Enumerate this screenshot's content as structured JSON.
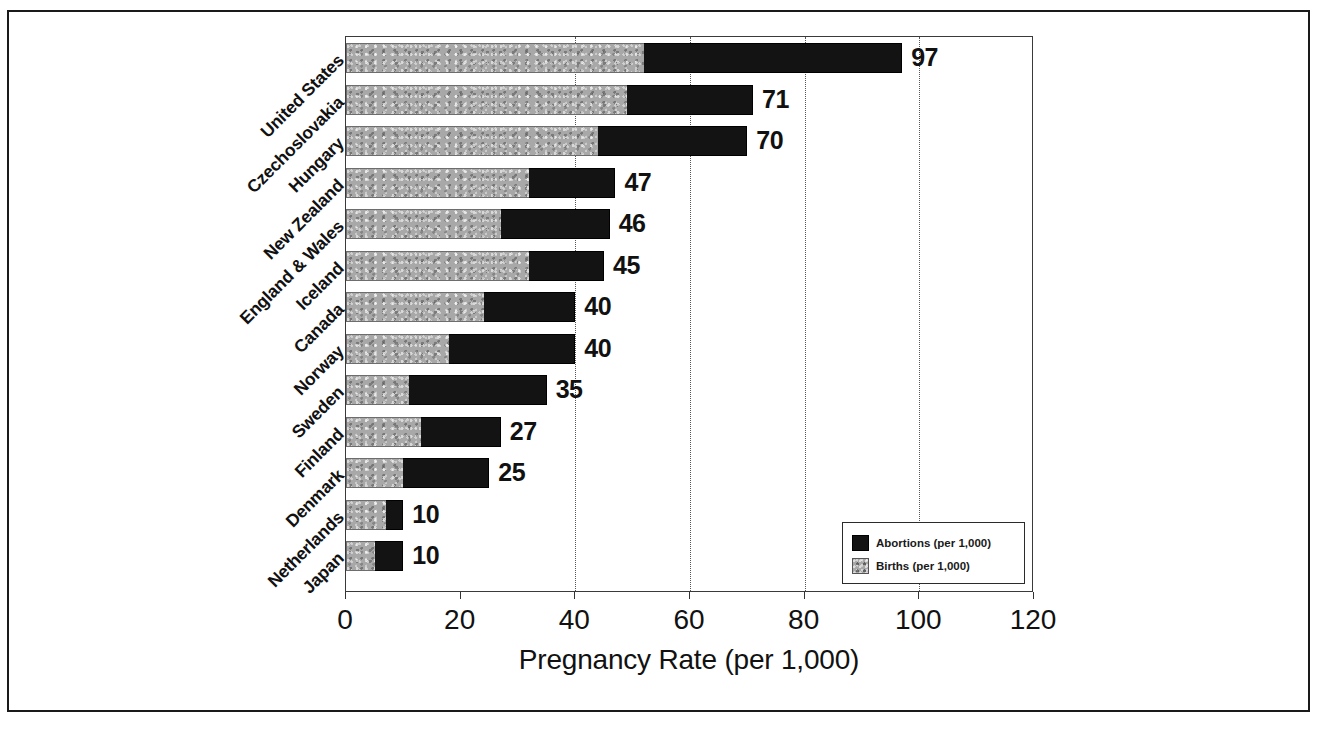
{
  "chart_data": {
    "type": "bar",
    "subtype": "stacked-horizontal",
    "title": "",
    "xlabel": "Pregnancy Rate (per 1,000)",
    "ylabel": "",
    "xlim": [
      0,
      120
    ],
    "xticks": [
      0,
      20,
      40,
      60,
      80,
      100,
      120
    ],
    "xticklabels": [
      "0",
      "20",
      "40",
      "60",
      "80",
      "100",
      "120"
    ],
    "gridlines": [
      40,
      60,
      80,
      100
    ],
    "grid": true,
    "legend_position": "lower-right",
    "legend": [
      {
        "name": "Abortions (per 1,000)",
        "color": "#131313"
      },
      {
        "name": "Births (per 1,000)",
        "color": "#a8a8a8"
      }
    ],
    "categories": [
      "United States",
      "Czechoslovakia",
      "Hungary",
      "New Zealand",
      "England & Wales",
      "Iceland",
      "Canada",
      "Norway",
      "Sweden",
      "Finland",
      "Denmark",
      "Netherlands",
      "Japan"
    ],
    "series": [
      {
        "name": "Births (per 1,000)",
        "values": [
          52,
          49,
          44,
          32,
          27,
          32,
          24,
          18,
          11,
          13,
          10,
          7,
          5
        ]
      },
      {
        "name": "Abortions (per 1,000)",
        "values": [
          45,
          22,
          26,
          15,
          19,
          13,
          16,
          22,
          24,
          14,
          15,
          3,
          5
        ]
      }
    ],
    "totals": [
      97,
      71,
      70,
      47,
      46,
      45,
      40,
      40,
      35,
      27,
      25,
      10,
      10
    ],
    "total_labels": [
      "97",
      "71",
      "70",
      "47",
      "46",
      "45",
      "40",
      "40",
      "35",
      "27",
      "25",
      "10",
      "10"
    ]
  },
  "axis": {
    "x_title": "Pregnancy Rate (per 1,000)"
  },
  "legend": {
    "items": [
      {
        "label": "Abortions (per 1,000)",
        "swatch": "black-swatch-icon"
      },
      {
        "label": "Births (per 1,000)",
        "swatch": "gray-texture-swatch-icon"
      }
    ]
  }
}
